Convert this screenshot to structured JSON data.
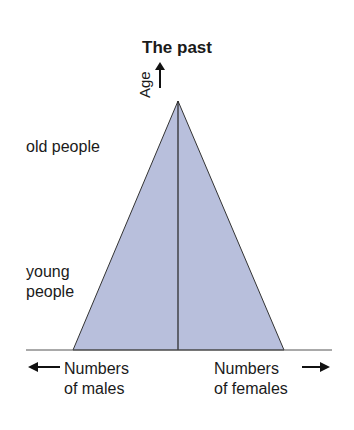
{
  "title": "The past",
  "axis": {
    "y_label": "Age",
    "x_left_label_line1": "Numbers",
    "x_left_label_line2": "of males",
    "x_right_label_line1": "Numbers",
    "x_right_label_line2": "of females"
  },
  "labels": {
    "top": "old people",
    "bottom_line1": "young",
    "bottom_line2": "people"
  },
  "colors": {
    "fill": "#b8bfdc",
    "stroke": "#333333"
  }
}
